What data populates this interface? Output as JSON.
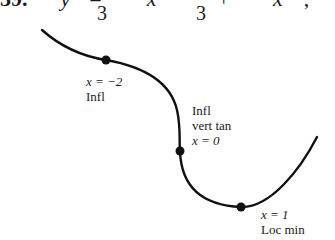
{
  "problem": {
    "number": "39.",
    "equation_visible": "y = ⅓x ... + ⅓x ...",
    "lhs": "y",
    "eq": "=",
    "plus": "+",
    "denominator_1": "3",
    "denominator_2": "3",
    "var": "x"
  },
  "points": [
    {
      "x_label": "x = −2",
      "desc": [
        "Infl"
      ]
    },
    {
      "x_label": "x = 0",
      "desc": [
        "Infl",
        "vert tan"
      ]
    },
    {
      "x_label": "x = 1",
      "desc": [
        "Loc min"
      ]
    }
  ],
  "labels": {
    "p1_x": "x = −2",
    "p1_desc": "Infl",
    "p2_desc1": "Infl",
    "p2_desc2": "vert tan",
    "p2_x": "x = 0",
    "p3_x": "x = 1",
    "p3_desc": "Loc min"
  },
  "colors": {
    "curve": "#111111",
    "text": "#1a1a1a",
    "background": "#ffffff"
  }
}
